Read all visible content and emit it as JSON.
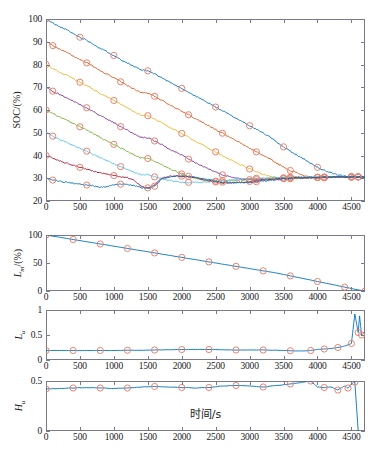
{
  "figure": {
    "xlabel": "时间/s",
    "marker_color": "#e8836f",
    "line_colors": [
      "#0072BD",
      "#D95319",
      "#EDB120",
      "#7E2F8E",
      "#77AC30",
      "#4DBEEE",
      "#A2142F",
      "#0072BD"
    ],
    "axis_color": "#7a7a86"
  },
  "chart_data": [
    {
      "type": "line",
      "panel": 1,
      "title": "",
      "ylabel": "SOC/(%)",
      "xlabel": "时间/s",
      "xlim": [
        0,
        4700
      ],
      "ylim": [
        20,
        100
      ],
      "xticks": [
        0,
        500,
        1000,
        1500,
        2000,
        2500,
        3000,
        3500,
        4000,
        4500
      ],
      "yticks": [
        20,
        30,
        40,
        50,
        60,
        70,
        80,
        90,
        100
      ],
      "grid": false,
      "legend": "none",
      "marker": "circle",
      "marker_interval": 470,
      "x": [
        0,
        100,
        200,
        300,
        400,
        500,
        600,
        700,
        800,
        900,
        1000,
        1100,
        1200,
        1300,
        1400,
        1500,
        1600,
        1700,
        1800,
        1900,
        2000,
        2100,
        2200,
        2300,
        2400,
        2500,
        2600,
        2700,
        2800,
        2900,
        3000,
        3100,
        3200,
        3300,
        3400,
        3500,
        3600,
        3700,
        3800,
        3900,
        4000,
        4100,
        4200,
        4300,
        4400,
        4500,
        4600,
        4700
      ],
      "series": [
        {
          "name": "SOC0=100",
          "values": [
            100,
            98.2,
            96.6,
            95.3,
            93.6,
            92.0,
            90.7,
            88.9,
            87.1,
            85.6,
            84.0,
            82.2,
            80.7,
            79.0,
            77.6,
            77.2,
            75.8,
            74.3,
            72.6,
            71.0,
            69.5,
            67.8,
            66.1,
            64.6,
            63.0,
            61.3,
            59.7,
            58.0,
            56.4,
            54.8,
            53.1,
            51.5,
            49.8,
            48.2,
            45.9,
            43.8,
            41.9,
            40.1,
            38.4,
            36.6,
            34.8,
            33.4,
            32.3,
            31.4,
            31.0,
            30.8,
            30.6,
            30.5
          ]
        },
        {
          "name": "SOC0=90",
          "values": [
            90,
            88.3,
            86.7,
            85.4,
            83.7,
            82.1,
            80.7,
            79.1,
            77.2,
            75.7,
            74.1,
            72.4,
            70.8,
            69.1,
            67.7,
            67.4,
            66.0,
            64.4,
            62.7,
            61.1,
            59.6,
            57.9,
            56.2,
            54.7,
            53.1,
            51.4,
            49.8,
            48.1,
            46.5,
            44.9,
            43.2,
            41.6,
            40.0,
            38.5,
            36.6,
            34.9,
            33.4,
            32.3,
            31.2,
            30.3,
            30.0,
            30.2,
            30.4,
            30.6,
            30.5,
            30.5,
            30.6,
            30.5
          ]
        },
        {
          "name": "SOC0=80",
          "values": [
            80,
            78.3,
            76.7,
            75.4,
            73.8,
            72.2,
            70.8,
            69.1,
            67.3,
            65.8,
            64.2,
            62.5,
            60.9,
            59.2,
            57.8,
            57.5,
            56.1,
            54.5,
            52.8,
            51.2,
            49.7,
            48.0,
            46.3,
            44.8,
            43.2,
            41.6,
            40.0,
            38.4,
            36.9,
            35.5,
            34.1,
            32.8,
            31.7,
            30.9,
            30.3,
            29.9,
            29.8,
            29.9,
            30.1,
            30.2,
            30.3,
            30.4,
            30.5,
            30.6,
            30.5,
            30.5,
            30.6,
            30.5
          ]
        },
        {
          "name": "SOC0=70",
          "values": [
            70,
            68.3,
            66.8,
            65.5,
            63.9,
            62.4,
            61.0,
            59.3,
            57.5,
            56.0,
            54.4,
            52.7,
            51.1,
            49.4,
            48.0,
            47.8,
            46.4,
            44.8,
            43.1,
            41.6,
            40.1,
            38.4,
            36.8,
            35.4,
            34.0,
            32.7,
            31.5,
            30.6,
            30.0,
            29.6,
            29.4,
            29.4,
            29.5,
            29.7,
            29.9,
            30.1,
            30.2,
            30.3,
            30.4,
            30.4,
            30.4,
            30.5,
            30.5,
            30.6,
            30.5,
            30.5,
            30.6,
            30.5
          ]
        },
        {
          "name": "SOC0=60",
          "values": [
            60,
            58.4,
            56.9,
            55.6,
            54.1,
            52.6,
            51.2,
            49.6,
            47.9,
            46.4,
            44.9,
            43.3,
            41.8,
            40.2,
            38.9,
            38.7,
            37.4,
            36.0,
            34.5,
            33.2,
            31.9,
            30.8,
            29.9,
            29.3,
            28.9,
            28.7,
            28.7,
            28.8,
            29.0,
            29.2,
            29.4,
            29.6,
            29.8,
            30.0,
            30.1,
            30.2,
            30.3,
            30.4,
            30.4,
            30.4,
            30.4,
            30.5,
            30.5,
            30.6,
            30.5,
            30.5,
            30.6,
            30.5
          ]
        },
        {
          "name": "SOC0=50",
          "values": [
            50,
            48.5,
            47.1,
            45.9,
            44.5,
            43.2,
            41.9,
            40.5,
            39.0,
            37.7,
            36.4,
            35.1,
            33.8,
            32.6,
            31.6,
            31.5,
            30.6,
            29.8,
            29.1,
            28.6,
            28.3,
            28.2,
            28.2,
            28.3,
            28.5,
            28.7,
            28.9,
            29.2,
            29.4,
            29.6,
            29.8,
            30.0,
            30.1,
            30.2,
            30.3,
            30.3,
            30.4,
            30.4,
            30.4,
            30.4,
            30.4,
            30.5,
            30.5,
            30.6,
            30.5,
            30.5,
            30.6,
            30.5
          ]
        },
        {
          "name": "SOC0=40",
          "values": [
            40,
            38.8,
            37.6,
            36.7,
            35.7,
            34.8,
            34.0,
            33.2,
            32.4,
            31.8,
            31.2,
            30.7,
            30.2,
            29.0,
            26.5,
            25.8,
            27.1,
            29.8,
            30.8,
            31.0,
            30.9,
            30.6,
            30.2,
            29.6,
            28.9,
            28.4,
            28.1,
            28.0,
            28.1,
            28.3,
            28.6,
            28.9,
            29.2,
            29.5,
            29.7,
            29.9,
            30.1,
            30.2,
            30.3,
            30.3,
            30.4,
            30.4,
            30.5,
            30.6,
            30.5,
            30.5,
            30.6,
            30.5
          ]
        },
        {
          "name": "SOC0=30",
          "values": [
            30,
            29.2,
            28.6,
            28.2,
            27.7,
            27.3,
            27.0,
            26.6,
            26.1,
            26.3,
            27.0,
            27.4,
            27.3,
            26.7,
            25.9,
            25.6,
            26.5,
            29.5,
            30.6,
            30.9,
            31.0,
            30.8,
            30.5,
            30.0,
            29.4,
            28.8,
            28.3,
            28.0,
            27.9,
            28.0,
            28.2,
            28.5,
            28.8,
            29.1,
            29.4,
            29.6,
            29.8,
            30.0,
            30.1,
            30.2,
            30.3,
            30.4,
            30.5,
            30.6,
            30.5,
            30.5,
            30.6,
            30.5
          ]
        }
      ]
    },
    {
      "type": "line",
      "panel": 2,
      "ylabel": "L_m/(%)",
      "ylabel_base": "L",
      "ylabel_sub": "m",
      "ylabel_tail": "/(%)",
      "xlim": [
        0,
        4700
      ],
      "ylim": [
        0,
        100
      ],
      "xticks": [
        0,
        500,
        1000,
        1500,
        2000,
        2500,
        3000,
        3500,
        4000,
        4500
      ],
      "yticks": [
        0,
        50,
        100
      ],
      "grid": false,
      "marker": "circle",
      "x": [
        0,
        200,
        400,
        600,
        800,
        1000,
        1200,
        1400,
        1600,
        1800,
        2000,
        2200,
        2400,
        2600,
        2800,
        3000,
        3200,
        3400,
        3600,
        3800,
        4000,
        4200,
        4400,
        4600,
        4700
      ],
      "values": [
        100,
        96,
        92,
        88,
        84,
        80,
        76,
        72,
        68,
        64,
        60,
        56,
        52,
        48,
        44,
        40,
        36,
        32,
        27,
        22,
        17,
        12,
        7,
        2,
        0
      ]
    },
    {
      "type": "line",
      "panel": 3,
      "ylabel": "L_u",
      "ylabel_base": "L",
      "ylabel_sub": "u",
      "xlim": [
        0,
        4700
      ],
      "ylim": [
        0,
        1
      ],
      "xticks": [
        0,
        500,
        1000,
        1500,
        2000,
        2500,
        3000,
        3500,
        4000,
        4500
      ],
      "yticks": [
        0,
        0.5,
        1
      ],
      "grid": false,
      "marker": "circle",
      "x": [
        0,
        200,
        400,
        600,
        800,
        1000,
        1200,
        1400,
        1600,
        1800,
        2000,
        2200,
        2400,
        2600,
        2800,
        3000,
        3200,
        3400,
        3600,
        3800,
        3900,
        4000,
        4100,
        4200,
        4300,
        4400,
        4500,
        4550,
        4600,
        4620,
        4650,
        4700
      ],
      "values": [
        0.19,
        0.19,
        0.19,
        0.19,
        0.19,
        0.19,
        0.195,
        0.195,
        0.2,
        0.205,
        0.21,
        0.21,
        0.21,
        0.205,
        0.2,
        0.2,
        0.2,
        0.195,
        0.185,
        0.18,
        0.19,
        0.21,
        0.22,
        0.23,
        0.25,
        0.28,
        0.33,
        0.92,
        0.55,
        0.88,
        0.5,
        0.56
      ]
    },
    {
      "type": "line",
      "panel": 4,
      "ylabel": "H_u",
      "ylabel_base": "H",
      "ylabel_sub": "u",
      "xlabel": "时间/s",
      "xlim": [
        0,
        4700
      ],
      "ylim": [
        0,
        0.5
      ],
      "xticks": [
        0,
        500,
        1000,
        1500,
        2000,
        2500,
        3000,
        3500,
        4000,
        4500
      ],
      "yticks": [
        0,
        0.5
      ],
      "grid": false,
      "marker": "circle",
      "x": [
        0,
        200,
        400,
        600,
        800,
        1000,
        1200,
        1400,
        1600,
        1800,
        2000,
        2200,
        2400,
        2600,
        2800,
        3000,
        3200,
        3400,
        3600,
        3800,
        3900,
        4000,
        4100,
        4200,
        4300,
        4400,
        4450,
        4500,
        4550,
        4600
      ],
      "values": [
        0.42,
        0.425,
        0.43,
        0.435,
        0.43,
        0.425,
        0.43,
        0.44,
        0.445,
        0.44,
        0.435,
        0.43,
        0.435,
        0.45,
        0.455,
        0.45,
        0.44,
        0.455,
        0.47,
        0.49,
        0.5,
        0.44,
        0.435,
        0.44,
        0.41,
        0.45,
        0.43,
        0.47,
        0.49,
        0.0
      ]
    }
  ]
}
